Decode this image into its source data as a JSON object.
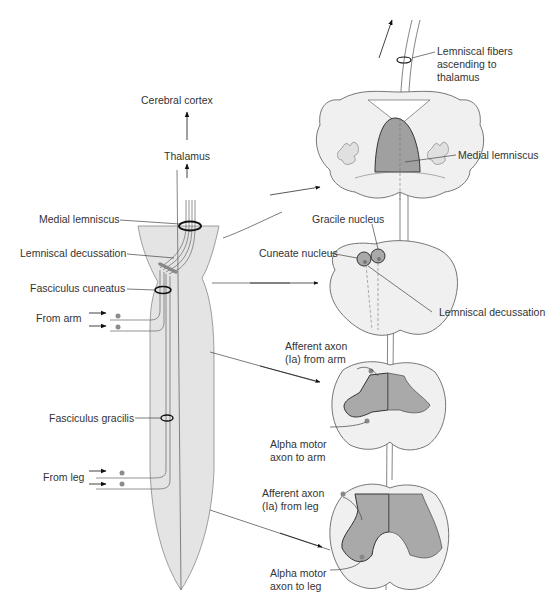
{
  "diagram": {
    "colors": {
      "tissue_fill": "#e4e4e4",
      "tissue_light": "#f2f2f2",
      "gray_matter": "#a9a9a9",
      "lemniscus_fill": "#a0a0a0",
      "line": "#555555",
      "ring": "#111111",
      "dot": "#8c8c8c"
    },
    "labels": {
      "cerebral_cortex": "Cerebral cortex",
      "thalamus": "Thalamus",
      "medial_lemniscus_left": "Medial lemniscus",
      "lemniscal_decussation_left": "Lemniscal decussation",
      "fasciculus_cuneatus": "Fasciculus cuneatus",
      "from_arm": "From arm",
      "fasciculus_gracilis": "Fasciculus gracilis",
      "from_leg": "From leg",
      "lemniscal_fibers": "Lemniscal fibers ascending to thalamus",
      "medial_lemniscus_right": "Medial lemniscus",
      "gracile_nucleus": "Gracile nucleus",
      "cuneate_nucleus": "Cuneate nucleus",
      "lemniscal_decussation_right": "Lemniscal decussation",
      "afferent_arm": "Afferent axon (Ia) from arm",
      "alpha_motor_arm": "Alpha motor axon to arm",
      "afferent_leg": "Afferent axon (Ia) from leg",
      "alpha_motor_leg": "Alpha motor axon to leg"
    },
    "sections": [
      "midbrain-pons",
      "medulla",
      "cervical-cord",
      "lumbar-cord"
    ]
  }
}
